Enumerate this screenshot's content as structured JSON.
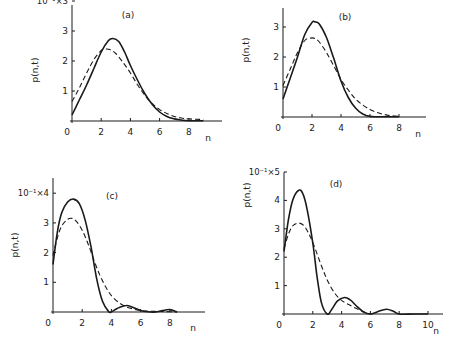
{
  "chart_data": [
    {
      "type": "line",
      "title": "(a)",
      "xlabel": "n",
      "ylabel": "p(n,t)",
      "y_scale_label": "10⁻¹×3",
      "x_ticks": [
        "0",
        "2",
        "4",
        "6",
        "8"
      ],
      "y_ticks": [
        "1",
        "2",
        "3"
      ],
      "xlim": [
        0,
        10
      ],
      "ylim": [
        0,
        3.8
      ],
      "series": [
        {
          "name": "solid",
          "style": "solid",
          "x": [
            0,
            0.5,
            1,
            1.5,
            2,
            2.5,
            2.8,
            3.2,
            3.6,
            4,
            4.5,
            5,
            5.5,
            6,
            6.5,
            7,
            7.5,
            8,
            9
          ],
          "y": [
            0.2,
            0.7,
            1.2,
            1.75,
            2.3,
            2.68,
            2.75,
            2.65,
            2.3,
            1.85,
            1.35,
            0.9,
            0.55,
            0.3,
            0.15,
            0.07,
            0.03,
            0.01,
            0.01
          ]
        },
        {
          "name": "dashed",
          "style": "dashed",
          "x": [
            0,
            0.5,
            1,
            1.5,
            2,
            2.3,
            2.6,
            3,
            3.5,
            4,
            4.5,
            5,
            5.5,
            6,
            6.5,
            7,
            7.5,
            8,
            9
          ],
          "y": [
            0.65,
            1.1,
            1.6,
            2.05,
            2.35,
            2.4,
            2.38,
            2.25,
            1.95,
            1.6,
            1.2,
            0.85,
            0.58,
            0.38,
            0.25,
            0.15,
            0.1,
            0.07,
            0.05
          ]
        }
      ]
    },
    {
      "type": "line",
      "title": "(b)",
      "xlabel": "n",
      "ylabel": "p(n,t)",
      "y_scale_label": "10⁻¹×3",
      "x_ticks": [
        "0",
        "2",
        "4",
        "6",
        "8"
      ],
      "y_ticks": [
        "1",
        "2",
        "3"
      ],
      "xlim": [
        0,
        10
      ],
      "ylim": [
        0,
        3.5
      ],
      "series": [
        {
          "name": "solid",
          "style": "solid",
          "x": [
            0,
            0.5,
            1,
            1.5,
            2,
            2.2,
            2.5,
            3,
            3.5,
            4,
            4.5,
            5,
            5.5,
            6,
            6.5,
            7,
            8
          ],
          "y": [
            0.6,
            1.3,
            2.0,
            2.75,
            3.15,
            3.17,
            3.1,
            2.65,
            1.95,
            1.2,
            0.65,
            0.3,
            0.1,
            0.02,
            0.01,
            0.01,
            0.01
          ]
        },
        {
          "name": "dashed",
          "style": "dashed",
          "x": [
            0,
            0.5,
            1,
            1.5,
            1.9,
            2.2,
            2.5,
            3,
            3.5,
            4,
            4.5,
            5,
            5.5,
            6,
            6.5,
            7,
            7.5,
            8
          ],
          "y": [
            1.05,
            1.6,
            2.15,
            2.55,
            2.63,
            2.62,
            2.5,
            2.15,
            1.7,
            1.25,
            0.9,
            0.6,
            0.4,
            0.25,
            0.15,
            0.08,
            0.04,
            0.02
          ]
        }
      ]
    },
    {
      "type": "line",
      "title": "(c)",
      "xlabel": "n",
      "ylabel": "p(n,t)",
      "y_scale_label": "10⁻¹×4",
      "x_ticks": [
        "0",
        "2",
        "4",
        "6",
        "8"
      ],
      "y_ticks": [
        "1",
        "2",
        "3"
      ],
      "xlim": [
        0,
        10
      ],
      "ylim": [
        0,
        4.3
      ],
      "series": [
        {
          "name": "solid",
          "style": "solid",
          "x": [
            0,
            0.3,
            0.6,
            1,
            1.4,
            1.8,
            2.2,
            2.6,
            3,
            3.4,
            3.8,
            4,
            4.4,
            5,
            5.5,
            6,
            6.5,
            7,
            7.5,
            8,
            8.5
          ],
          "y": [
            1.6,
            2.7,
            3.35,
            3.7,
            3.8,
            3.65,
            3.1,
            2.2,
            1.1,
            0.35,
            0.02,
            0.0,
            0.12,
            0.22,
            0.15,
            0.05,
            0.01,
            0.0,
            0.05,
            0.08,
            0.0
          ]
        },
        {
          "name": "dashed",
          "style": "dashed",
          "x": [
            0,
            0.3,
            0.6,
            1,
            1.3,
            1.6,
            2,
            2.4,
            2.8,
            3.2,
            3.6,
            4,
            4.5,
            5,
            5.5,
            6,
            6.5,
            7,
            8,
            8.5
          ],
          "y": [
            1.9,
            2.5,
            2.9,
            3.12,
            3.15,
            3.05,
            2.75,
            2.3,
            1.75,
            1.25,
            0.85,
            0.55,
            0.32,
            0.18,
            0.1,
            0.05,
            0.03,
            0.02,
            0.01,
            0.0
          ]
        }
      ]
    },
    {
      "type": "line",
      "title": "(d)",
      "xlabel": "n",
      "ylabel": "p(n,t)",
      "y_scale_label": "10⁻¹×5",
      "x_ticks": [
        "0",
        "2",
        "4",
        "6",
        "8",
        "10"
      ],
      "y_ticks": [
        "1",
        "2",
        "3",
        "4"
      ],
      "xlim": [
        0,
        11
      ],
      "ylim": [
        0,
        5.3
      ],
      "series": [
        {
          "name": "solid",
          "style": "solid",
          "x": [
            0,
            0.3,
            0.6,
            1,
            1.3,
            1.6,
            2,
            2.3,
            2.6,
            3,
            3.3,
            3.7,
            4.2,
            4.6,
            5,
            5.5,
            6,
            6.5,
            7.1,
            7.6,
            8,
            9,
            10
          ],
          "y": [
            2.2,
            3.3,
            4.0,
            4.35,
            4.25,
            3.7,
            2.5,
            1.3,
            0.4,
            0.0,
            0.15,
            0.45,
            0.58,
            0.5,
            0.3,
            0.08,
            0.0,
            0.08,
            0.17,
            0.1,
            0.0,
            0.0,
            0.0
          ]
        },
        {
          "name": "dashed",
          "style": "dashed",
          "x": [
            0,
            0.3,
            0.6,
            1,
            1.4,
            1.8,
            2.2,
            2.6,
            3,
            3.5,
            4,
            4.5,
            5,
            5.5,
            6
          ],
          "y": [
            2.3,
            2.8,
            3.1,
            3.2,
            3.1,
            2.75,
            2.25,
            1.7,
            1.2,
            0.75,
            0.48,
            0.33,
            0.2,
            0.08,
            0.0
          ]
        }
      ]
    }
  ]
}
